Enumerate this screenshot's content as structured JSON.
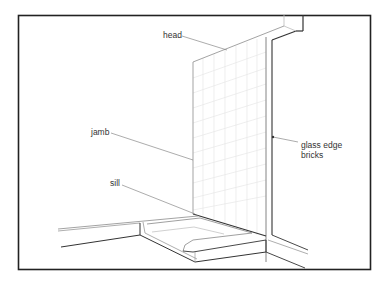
{
  "diagram": {
    "type": "technical-illustration",
    "labels": {
      "head": "head",
      "jamb": "jamb",
      "sill": "sill",
      "glass_edge_line1": "glass edge",
      "glass_edge_line2": "bricks"
    },
    "colors": {
      "frame": "#222222",
      "line_dark": "#333333",
      "line_light": "#9a9a9a",
      "block_grid": "#e4e4e4",
      "text": "#333333"
    }
  }
}
